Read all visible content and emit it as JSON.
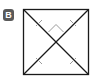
{
  "label": "B",
  "figure": {
    "shape": "square",
    "colors": {
      "outline": "#1a1a1a",
      "marks": "#9a9a9a",
      "badge": "#5a5a5a"
    }
  }
}
